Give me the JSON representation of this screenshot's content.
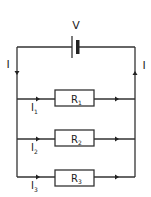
{
  "diagram": {
    "battery_label": "V",
    "main_current_left": "I",
    "main_current_right": "I",
    "branches": [
      {
        "resistor": "R",
        "resistor_sub": "1",
        "current": "I",
        "current_sub": "1"
      },
      {
        "resistor": "R",
        "resistor_sub": "2",
        "current": "I",
        "current_sub": "2"
      },
      {
        "resistor": "R",
        "resistor_sub": "3",
        "current": "I",
        "current_sub": "3"
      }
    ],
    "colors": {
      "wire": "#333333",
      "background": "#ffffff"
    }
  }
}
